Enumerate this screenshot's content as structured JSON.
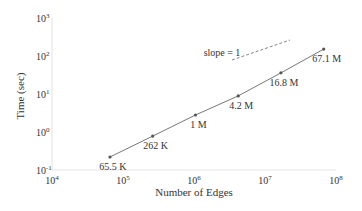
{
  "chart_data": {
    "type": "line",
    "title": "",
    "xlabel": "Number of Edges",
    "ylabel": "Time (sec)",
    "xscale": "log",
    "yscale": "log",
    "xlim": [
      10000,
      100000000
    ],
    "ylim": [
      0.1,
      1000
    ],
    "x_ticks": [
      "10^4",
      "10^5",
      "10^6",
      "10^7",
      "10^8"
    ],
    "y_ticks": [
      "10^-1",
      "10^0",
      "10^1",
      "10^2",
      "10^3"
    ],
    "grid": false,
    "series": [
      {
        "name": "runtime",
        "color": "#777777",
        "x": [
          65536,
          262144,
          1048576,
          4194304,
          16777216,
          67108864
        ],
        "y": [
          0.22,
          0.78,
          2.8,
          8.9,
          36,
          152
        ],
        "point_labels": [
          "65.5 K",
          "262 K",
          "1 M",
          "4.2 M",
          "16.8 M",
          "67.1 M"
        ]
      }
    ],
    "annotations": [
      {
        "text": "slope = 1",
        "type": "reference-line",
        "style": "dashed",
        "color": "#777777"
      }
    ]
  },
  "axes": {
    "xlabel": "Number of Edges",
    "ylabel": "Time (sec)",
    "x_ticks": [
      {
        "base": "10",
        "exp": "4"
      },
      {
        "base": "10",
        "exp": "5"
      },
      {
        "base": "10",
        "exp": "6"
      },
      {
        "base": "10",
        "exp": "7"
      },
      {
        "base": "10",
        "exp": "8"
      }
    ],
    "y_ticks": [
      {
        "base": "10",
        "exp": "-1"
      },
      {
        "base": "10",
        "exp": "0"
      },
      {
        "base": "10",
        "exp": "1"
      },
      {
        "base": "10",
        "exp": "2"
      },
      {
        "base": "10",
        "exp": "3"
      }
    ]
  },
  "annotation": {
    "slope_label": "slope = 1"
  },
  "colors": {
    "line": "#777777",
    "axis": "#e6e6e6",
    "text": "#333333"
  }
}
